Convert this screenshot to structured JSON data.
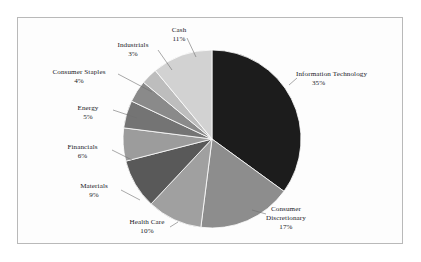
{
  "chart_data": {
    "type": "pie",
    "title": "",
    "subtitle": "",
    "legend_position": "callout-labels",
    "grid": false,
    "start_angle_deg": 0,
    "direction": "clockwise",
    "unit": "%",
    "categories": [
      "Information Technology",
      "Consumer Discretionary",
      "Health Care",
      "Materials",
      "Financials",
      "Energy",
      "Consumer Staples",
      "Industrials",
      "Cash"
    ],
    "values": [
      35,
      17,
      10,
      9,
      6,
      5,
      4,
      3,
      11
    ],
    "total": 100,
    "slices": [
      {
        "label": "Information Technology",
        "label_line1": "Information Technology",
        "label_line2": "",
        "value": 35,
        "pct_text": "35%",
        "color": "#1c1c1c"
      },
      {
        "label": "Consumer Discretionary",
        "label_line1": "Consumer",
        "label_line2": "Discretionary",
        "value": 17,
        "pct_text": "17%",
        "color": "#8d8d8d"
      },
      {
        "label": "Health Care",
        "label_line1": "Health Care",
        "label_line2": "",
        "value": 10,
        "pct_text": "10%",
        "color": "#a0a0a0"
      },
      {
        "label": "Materials",
        "label_line1": "Materials",
        "label_line2": "",
        "value": 9,
        "pct_text": "9%",
        "color": "#595959"
      },
      {
        "label": "Financials",
        "label_line1": "Financials",
        "label_line2": "",
        "value": 6,
        "pct_text": "6%",
        "color": "#9c9c9c"
      },
      {
        "label": "Energy",
        "label_line1": "Energy",
        "label_line2": "",
        "value": 5,
        "pct_text": "5%",
        "color": "#747474"
      },
      {
        "label": "Consumer Staples",
        "label_line1": "Consumer Staples",
        "label_line2": "",
        "value": 4,
        "pct_text": "4%",
        "color": "#8a8a8a"
      },
      {
        "label": "Industrials",
        "label_line1": "Industrials",
        "label_line2": "",
        "value": 3,
        "pct_text": "3%",
        "color": "#bdbdbd"
      },
      {
        "label": "Cash",
        "label_line1": "Cash",
        "label_line2": "",
        "value": 11,
        "pct_text": "11%",
        "color": "#d2d2d2"
      }
    ],
    "colors": {
      "background": "#ffffff",
      "frame_border": "#b9b9b9",
      "slice_outline": "#ffffff",
      "label_text": "#20201f",
      "leader_line": "#6f6f6f"
    }
  }
}
